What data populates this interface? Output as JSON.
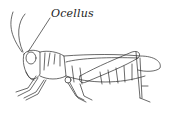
{
  "figure": {
    "labels": [
      {
        "text": "Ocellus",
        "target": "ocellus"
      }
    ]
  },
  "colors": {
    "line": "#2a2a2a",
    "background": "#ffffff"
  }
}
